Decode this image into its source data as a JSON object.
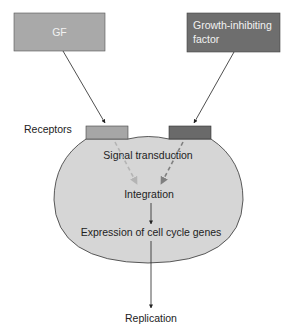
{
  "diagram": {
    "inputs": {
      "gf": {
        "label": "GF",
        "color": "#a9a9a9"
      },
      "inhibitor": {
        "label_line1": "Growth-inhibiting",
        "label_line2": "factor",
        "color": "#6e6e6e"
      }
    },
    "receptors": {
      "label": "Receptors",
      "left_color": "#a6a6a6",
      "right_color": "#6a6a6a"
    },
    "cell": {
      "fill": "#d6d6d6",
      "steps": {
        "signal_transduction": "Signal transduction",
        "integration": "Integration",
        "expression": "Expression of cell cycle genes"
      }
    },
    "output": {
      "label": "Replication"
    },
    "colors": {
      "arrow": "#222222",
      "dashed_left": "#b4b4b4",
      "dashed_right": "#808080",
      "outline": "#333333"
    }
  }
}
